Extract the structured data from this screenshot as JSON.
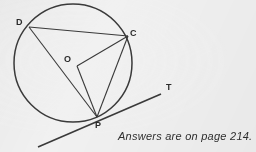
{
  "figure": {
    "kind": "circle-geometry-diagram",
    "caption": "Answers are on page 214.",
    "stroke_color": "#3a3a3a",
    "background_color": "#f1f1f1",
    "labels": {
      "center": "O",
      "point_c": "C",
      "point_d": "D",
      "point_p": "P",
      "tangent": "T"
    },
    "points": {
      "O": {
        "x": 73,
        "y": 64
      },
      "C": {
        "x": 128,
        "y": 36
      },
      "D": {
        "x": 29,
        "y": 27
      },
      "P": {
        "x": 97,
        "y": 117
      },
      "T": {
        "x": 161,
        "y": 94
      }
    },
    "circle": {
      "cx": 73,
      "cy": 63,
      "r": 59
    },
    "segments": [
      {
        "name": "DC",
        "from": "D",
        "to": "C"
      },
      {
        "name": "DP",
        "from": "D",
        "to": "P"
      },
      {
        "name": "CP",
        "from": "C",
        "to": "P"
      },
      {
        "name": "OC",
        "from": "O",
        "to": "C"
      },
      {
        "name": "OP",
        "from": "O",
        "to": "P"
      }
    ],
    "tangent_line": {
      "from": {
        "x": 38,
        "y": 147
      },
      "to": {
        "x": 161,
        "y": 94
      }
    }
  }
}
